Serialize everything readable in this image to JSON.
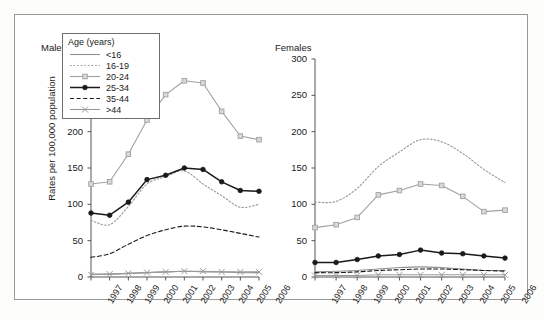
{
  "figure": {
    "panels": [
      {
        "key": "males",
        "title": "Males"
      },
      {
        "key": "females",
        "title": "Females"
      }
    ],
    "ylabel": "Rates per 100,000 population",
    "legend_title": "Age (years)"
  },
  "chart_data": {
    "type": "line",
    "title": "",
    "xlabel": "",
    "ylabel": "Rates per 100,000 population",
    "x": [
      1997,
      1998,
      1999,
      2000,
      2001,
      2002,
      2003,
      2004,
      2005,
      2006
    ],
    "xticklabels": [
      "1997",
      "1998",
      "1999",
      "2000",
      "2001",
      "2002",
      "2003",
      "2004",
      "2005",
      "2006"
    ],
    "ylim": [
      0,
      300
    ],
    "yticks": [
      0,
      50,
      100,
      150,
      200,
      250,
      300
    ],
    "yticklabels": [
      "0",
      "50",
      "100",
      "150",
      "200",
      "250",
      "300"
    ],
    "grid": false,
    "legend_position": "upper-left",
    "legend_title": "Age (years)",
    "panels": [
      {
        "name": "Males",
        "series": [
          {
            "name": "<16",
            "style": "solid",
            "marker": "none",
            "color": "#8f8f8f",
            "values": [
              4,
              4,
              5,
              6,
              7,
              8,
              7,
              7,
              6,
              6
            ]
          },
          {
            "name": "16-19",
            "style": "dotted",
            "marker": "none",
            "color": "#9a9a9a",
            "values": [
              78,
              72,
              97,
              128,
              138,
              146,
              128,
              112,
              96,
              100
            ]
          },
          {
            "name": "20-24",
            "style": "solid",
            "marker": "square",
            "color": "#a0a0a0",
            "values": [
              128,
              131,
              169,
              216,
              251,
              270,
              267,
              228,
              194,
              189
            ]
          },
          {
            "name": "25-34",
            "style": "solid",
            "marker": "circle",
            "color": "#1a1a1a",
            "values": [
              88,
              85,
              103,
              134,
              140,
              150,
              148,
              131,
              119,
              118
            ]
          },
          {
            "name": "35-44",
            "style": "dashed",
            "marker": "none",
            "color": "#1a1a1a",
            "values": [
              27,
              32,
              45,
              57,
              65,
              70,
              69,
              65,
              60,
              55
            ]
          },
          {
            "name": ">44",
            "style": "solid",
            "marker": "x",
            "color": "#9a9a9a",
            "values": [
              3,
              4,
              5,
              6,
              7,
              8,
              8,
              7,
              7,
              7
            ]
          }
        ]
      },
      {
        "name": "Females",
        "series": [
          {
            "name": "<16",
            "style": "solid",
            "marker": "none",
            "color": "#8f8f8f",
            "values": [
              7,
              8,
              9,
              11,
              13,
              14,
              13,
              11,
              9,
              9
            ]
          },
          {
            "name": "16-19",
            "style": "dotted",
            "marker": "none",
            "color": "#9a9a9a",
            "values": [
              103,
              104,
              122,
              152,
              172,
              189,
              186,
              170,
              148,
              130
            ]
          },
          {
            "name": "20-24",
            "style": "solid",
            "marker": "square",
            "color": "#a0a0a0",
            "values": [
              68,
              72,
              82,
              113,
              119,
              128,
              126,
              111,
              90,
              92
            ]
          },
          {
            "name": "25-34",
            "style": "solid",
            "marker": "circle",
            "color": "#1a1a1a",
            "values": [
              20,
              20,
              24,
              29,
              31,
              37,
              33,
              32,
              29,
              26
            ]
          },
          {
            "name": "35-44",
            "style": "dashed",
            "marker": "none",
            "color": "#1a1a1a",
            "values": [
              6,
              6,
              7,
              9,
              10,
              11,
              11,
              10,
              9,
              8
            ]
          },
          {
            "name": ">44",
            "style": "solid",
            "marker": "x",
            "color": "#9a9a9a",
            "values": [
              2,
              2,
              2,
              3,
              3,
              3,
              3,
              3,
              3,
              3
            ]
          }
        ]
      }
    ]
  },
  "legend": {
    "title": "Age (years)",
    "items": [
      {
        "label": "<16",
        "style": "solid",
        "marker": "none",
        "color": "#8f8f8f"
      },
      {
        "label": "16-19",
        "style": "dotted",
        "marker": "none",
        "color": "#9a9a9a"
      },
      {
        "label": "20-24",
        "style": "solid",
        "marker": "square",
        "color": "#a0a0a0"
      },
      {
        "label": "25-34",
        "style": "solid",
        "marker": "circle",
        "color": "#1a1a1a"
      },
      {
        "label": "35-44",
        "style": "dashed",
        "marker": "none",
        "color": "#1a1a1a"
      },
      {
        "label": ">44",
        "style": "solid",
        "marker": "x",
        "color": "#9a9a9a"
      }
    ]
  }
}
